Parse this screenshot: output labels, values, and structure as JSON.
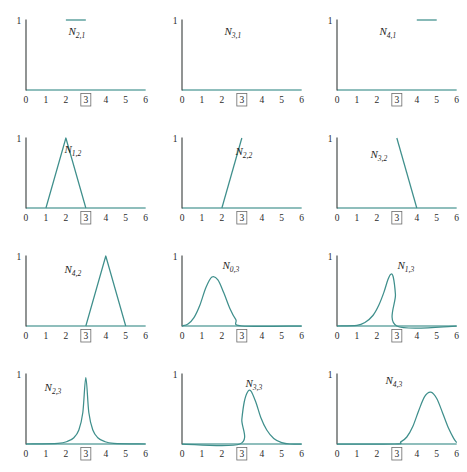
{
  "figure": {
    "rows": 4,
    "cols": 3,
    "background": "#ffffff",
    "curve_color": "#3f8f8c",
    "xaxis_color": "#6aa9a6",
    "yaxis_color": "#3f4443",
    "highlight_tick": "3"
  },
  "axes": {
    "x_ticks": [
      "0",
      "1",
      "2",
      "3",
      "4",
      "5",
      "6"
    ],
    "x_tick_values": [
      0,
      1,
      2,
      3,
      4,
      5,
      6
    ],
    "y_ticks": [
      "1"
    ],
    "y_tick_values": [
      1
    ],
    "xlim": [
      0,
      6
    ],
    "ylim": [
      0,
      1
    ]
  },
  "chart_data": {
    "type": "line",
    "title": "",
    "subtitle": "",
    "xlabel": "",
    "ylabel": "",
    "xlim": [
      0,
      6
    ],
    "ylim": [
      0,
      1
    ],
    "grid": false,
    "legend": "none",
    "x_tick_labels": [
      "0",
      "1",
      "2",
      "3",
      "4",
      "5",
      "6"
    ],
    "y_tick_labels": [
      "1"
    ],
    "highlighted_x_tick": "3",
    "panels": [
      {
        "id": "N_2_1",
        "label_base": "N",
        "label_sub": "2,1",
        "row": 0,
        "col": 0,
        "label_x": 2.55,
        "label_y": 0.78,
        "shape": "polyline",
        "points": [
          [
            2,
            1
          ],
          [
            3,
            1
          ]
        ],
        "description": "constant segment at y=1 on [2,3]"
      },
      {
        "id": "N_3_1",
        "label_base": "N",
        "label_sub": "3,1",
        "row": 0,
        "col": 1,
        "label_x": 2.55,
        "label_y": 0.78,
        "shape": "polyline",
        "points": [],
        "description": "identically zero over [0,6]"
      },
      {
        "id": "N_4_1",
        "label_base": "N",
        "label_sub": "4,1",
        "row": 0,
        "col": 2,
        "label_x": 2.55,
        "label_y": 0.78,
        "shape": "polyline",
        "points": [
          [
            4,
            1
          ],
          [
            5,
            1
          ]
        ],
        "description": "constant segment at y=1 on [4,5]"
      },
      {
        "id": "N_1_2",
        "label_base": "N",
        "label_sub": "1,2",
        "row": 1,
        "col": 0,
        "label_x": 2.35,
        "label_y": 0.78,
        "shape": "polyline",
        "points": [
          [
            1,
            0
          ],
          [
            2,
            1
          ],
          [
            3,
            0
          ]
        ],
        "description": "hat function peaking at x=2"
      },
      {
        "id": "N_2_2",
        "label_base": "N",
        "label_sub": "2,2",
        "row": 1,
        "col": 1,
        "label_x": 3.1,
        "label_y": 0.76,
        "shape": "polyline",
        "points": [
          [
            2,
            0
          ],
          [
            3,
            1
          ]
        ],
        "description": "linear ramp from 0 at x=2 to 1 at x=3"
      },
      {
        "id": "N_3_2",
        "label_base": "N",
        "label_sub": "3,2",
        "row": 1,
        "col": 2,
        "label_x": 2.1,
        "label_y": 0.72,
        "shape": "polyline",
        "points": [
          [
            3,
            1
          ],
          [
            4,
            0
          ]
        ],
        "description": "linear decay from 1 at x=3 to 0 at x=4"
      },
      {
        "id": "N_4_2",
        "label_base": "N",
        "label_sub": "4,2",
        "row": 2,
        "col": 0,
        "label_x": 2.35,
        "label_y": 0.76,
        "shape": "polyline",
        "points": [
          [
            3,
            0
          ],
          [
            4,
            1
          ],
          [
            5,
            0
          ]
        ],
        "description": "hat function peaking at x=4"
      },
      {
        "id": "N_0_3",
        "label_base": "N",
        "label_sub": "0,3",
        "row": 2,
        "col": 1,
        "label_x": 2.45,
        "label_y": 0.82,
        "shape": "curve",
        "points": [
          [
            0,
            0
          ],
          [
            0.3,
            0.03
          ],
          [
            0.6,
            0.12
          ],
          [
            0.9,
            0.3
          ],
          [
            1.2,
            0.55
          ],
          [
            1.5,
            0.7
          ],
          [
            1.8,
            0.66
          ],
          [
            2.1,
            0.47
          ],
          [
            2.4,
            0.25
          ],
          [
            2.7,
            0.09
          ],
          [
            3,
            0
          ],
          [
            6,
            0
          ]
        ],
        "peak": [
          1.55,
          0.71
        ],
        "description": "smooth bell peaking near x=1.55, support [0,3]"
      },
      {
        "id": "N_1_3",
        "label_base": "N",
        "label_sub": "1,3",
        "row": 2,
        "col": 2,
        "label_x": 3.45,
        "label_y": 0.82,
        "shape": "curve",
        "points": [
          [
            0,
            0
          ],
          [
            1,
            0.01
          ],
          [
            1.4,
            0.05
          ],
          [
            1.8,
            0.15
          ],
          [
            2.1,
            0.3
          ],
          [
            2.35,
            0.48
          ],
          [
            2.55,
            0.66
          ],
          [
            2.7,
            0.74
          ],
          [
            2.82,
            0.7
          ],
          [
            2.93,
            0.45
          ],
          [
            3,
            0
          ],
          [
            6,
            0
          ]
        ],
        "peak": [
          2.68,
          0.75
        ],
        "description": "asymmetric peak near x=2.7, sharp drop at x=3"
      },
      {
        "id": "N_2_3",
        "label_base": "N",
        "label_sub": "2,3",
        "row": 3,
        "col": 0,
        "label_x": 1.35,
        "label_y": 0.76,
        "shape": "curve",
        "points": [
          [
            0,
            0
          ],
          [
            1.6,
            0.01
          ],
          [
            2.1,
            0.04
          ],
          [
            2.4,
            0.09
          ],
          [
            2.65,
            0.2
          ],
          [
            2.85,
            0.45
          ],
          [
            3,
            0.95
          ],
          [
            3.15,
            0.45
          ],
          [
            3.35,
            0.2
          ],
          [
            3.6,
            0.09
          ],
          [
            3.9,
            0.04
          ],
          [
            4.4,
            0.01
          ],
          [
            6,
            0
          ]
        ],
        "peak": [
          3,
          0.95
        ],
        "description": "tall narrow spike centered at x=3"
      },
      {
        "id": "N_3_3",
        "label_base": "N",
        "label_sub": "3,3",
        "row": 3,
        "col": 1,
        "label_x": 3.6,
        "label_y": 0.82,
        "shape": "curve",
        "points": [
          [
            0,
            0
          ],
          [
            2.9,
            0
          ],
          [
            3,
            0.35
          ],
          [
            3.12,
            0.6
          ],
          [
            3.28,
            0.74
          ],
          [
            3.45,
            0.76
          ],
          [
            3.7,
            0.6
          ],
          [
            3.95,
            0.38
          ],
          [
            4.25,
            0.2
          ],
          [
            4.6,
            0.08
          ],
          [
            5,
            0.02
          ],
          [
            5.4,
            0
          ],
          [
            6,
            0
          ]
        ],
        "peak": [
          3.42,
          0.77
        ],
        "description": "steep rise at x=3, peak near x=3.4, decay to x=5"
      },
      {
        "id": "N_4_3",
        "label_base": "N",
        "label_sub": "4,3",
        "row": 3,
        "col": 2,
        "label_x": 2.85,
        "label_y": 0.85,
        "shape": "curve",
        "points": [
          [
            0,
            0
          ],
          [
            2.9,
            0
          ],
          [
            3.2,
            0.03
          ],
          [
            3.5,
            0.1
          ],
          [
            3.8,
            0.25
          ],
          [
            4.1,
            0.48
          ],
          [
            4.4,
            0.68
          ],
          [
            4.7,
            0.74
          ],
          [
            5,
            0.65
          ],
          [
            5.3,
            0.44
          ],
          [
            5.6,
            0.22
          ],
          [
            5.85,
            0.08
          ],
          [
            6,
            0.02
          ]
        ],
        "peak": [
          4.65,
          0.75
        ],
        "description": "broad bell peaking near x=4.65, support [3,6]"
      }
    ]
  }
}
